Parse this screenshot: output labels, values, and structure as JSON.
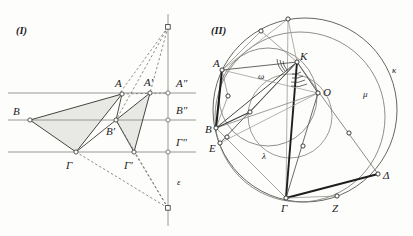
{
  "figures": {
    "left": {
      "caption": "(I)",
      "line_label": "ε",
      "points": [
        {
          "name": "A",
          "label": "A",
          "x": 122,
          "y": 94
        },
        {
          "name": "B",
          "label": "B",
          "x": 30,
          "y": 120
        },
        {
          "name": "G",
          "label": "Γ",
          "x": 76,
          "y": 152
        },
        {
          "name": "A1",
          "label": "A′",
          "x": 150,
          "y": 93
        },
        {
          "name": "B1",
          "label": "B′",
          "x": 116,
          "y": 120
        },
        {
          "name": "G1",
          "label": "Γ′",
          "x": 134,
          "y": 152
        },
        {
          "name": "A2",
          "label": "A″",
          "x": 168,
          "y": 93
        },
        {
          "name": "B2",
          "label": "B″",
          "x": 168,
          "y": 120
        },
        {
          "name": "G2",
          "label": "Γ″",
          "x": 168,
          "y": 152
        },
        {
          "name": "S_top",
          "label": "",
          "x": 168,
          "y": 27
        },
        {
          "name": "S_bot",
          "label": "",
          "x": 168,
          "y": 208
        }
      ],
      "horizontal_lines_y": [
        93,
        120,
        152
      ],
      "vertical_line_x": 168
    },
    "right": {
      "caption": "(II)",
      "circle_labels": [
        {
          "name": "kappa",
          "label": "κ",
          "x": 392,
          "y": 70
        },
        {
          "name": "mu",
          "label": "μ",
          "x": 363,
          "y": 94
        },
        {
          "name": "lambda",
          "label": "λ",
          "x": 262,
          "y": 156
        },
        {
          "name": "omega",
          "label": "ω",
          "x": 262,
          "y": 76
        }
      ],
      "points": [
        {
          "name": "A",
          "label": "A",
          "x": 222,
          "y": 70
        },
        {
          "name": "K",
          "label": "K",
          "x": 297,
          "y": 62
        },
        {
          "name": "O",
          "label": "O",
          "x": 318,
          "y": 93
        },
        {
          "name": "B",
          "label": "B",
          "x": 216,
          "y": 128
        },
        {
          "name": "E",
          "label": "E",
          "x": 220,
          "y": 143
        },
        {
          "name": "G",
          "label": "Γ",
          "x": 286,
          "y": 198
        },
        {
          "name": "Z",
          "label": "Z",
          "x": 337,
          "y": 196
        },
        {
          "name": "D",
          "label": "Δ",
          "x": 378,
          "y": 174
        }
      ]
    }
  },
  "colors": {
    "stroke_dark": "#2a2a28",
    "stroke_mid": "#6b6b68",
    "stroke_light": "#9a9a96",
    "fill_shade": "#e6e6e2",
    "background": "#fdfdfc"
  }
}
